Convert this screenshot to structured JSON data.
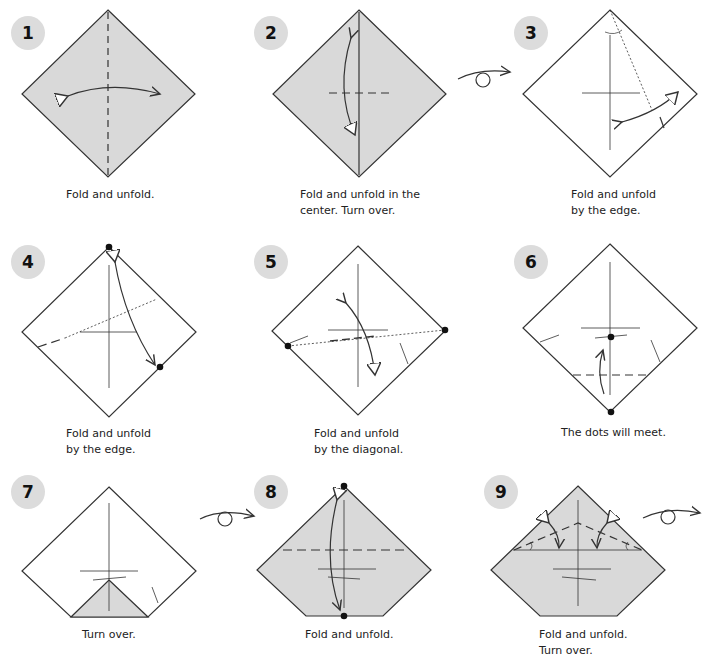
{
  "diagram": {
    "type": "origami-instructions",
    "colors": {
      "paper_colored": "#d9d9d9",
      "paper_white": "#ffffff",
      "line": "#333333",
      "badge": "#dcdcdc"
    },
    "steps": [
      {
        "number": "1",
        "caption": "Fold and unfold."
      },
      {
        "number": "2",
        "caption": "Fold and unfold in the\ncenter. Turn over."
      },
      {
        "number": "3",
        "caption": "Fold and unfold\nby the edge."
      },
      {
        "number": "4",
        "caption": "Fold and unfold\nby the edge."
      },
      {
        "number": "5",
        "caption": "Fold and unfold\nby the diagonal."
      },
      {
        "number": "6",
        "caption": "The dots will meet."
      },
      {
        "number": "7",
        "caption": "Turn over."
      },
      {
        "number": "8",
        "caption": "Fold and unfold."
      },
      {
        "number": "9",
        "caption": "Fold and unfold.\nTurn over."
      }
    ],
    "turn_over_symbols": [
      "between-step-2-and-3",
      "between-step-7-and-8",
      "after-step-9"
    ]
  }
}
